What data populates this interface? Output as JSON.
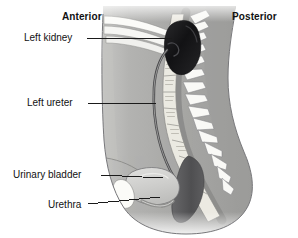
{
  "figure": {
    "background_color": "#ffffff",
    "orientation_labels": {
      "anterior": "Anterior",
      "posterior": "Posterior"
    }
  },
  "labels": [
    {
      "id": "left-kidney",
      "text": "Left kidney",
      "bold": false
    },
    {
      "id": "left-ureter",
      "text": "Left ureter",
      "bold": false
    },
    {
      "id": "urinary-bladder",
      "text": "Urinary bladder",
      "bold": false
    },
    {
      "id": "urethra",
      "text": "Urethra",
      "bold": false
    }
  ],
  "structures": [
    {
      "id": "kidney",
      "name": "Left kidney",
      "color": "#1d1d1f"
    },
    {
      "id": "ureter",
      "name": "Left ureter",
      "color": "#4a4a4c"
    },
    {
      "id": "bladder",
      "name": "Urinary bladder",
      "color": "#d3d3d3"
    },
    {
      "id": "urethra",
      "name": "Urethra",
      "color": "#9a9a9a"
    },
    {
      "id": "spine",
      "name": "Vertebral column",
      "color": "#f0efea"
    },
    {
      "id": "rectum",
      "name": "Rectum",
      "color": "#5c5c5e"
    },
    {
      "id": "pubis",
      "name": "Pubic bone",
      "color": "#f7f7f4"
    },
    {
      "id": "diaphragm",
      "name": "Diaphragm / ribs",
      "color": "#fbfbf8"
    },
    {
      "id": "body",
      "name": "Body outline",
      "color": "#a9a9a7"
    }
  ],
  "palette": {
    "body_fill": "#a9a9a7",
    "body_fill_light": "#bcbcba",
    "outline": "#6e6e6e",
    "leader_line": "#1a1a1a",
    "text": "#111111",
    "bone_white": "#f8f8f5",
    "kidney_dark": "#1d1d1f",
    "rectum_dark": "#5c5c5e",
    "bladder_gray": "#d2d2d0"
  }
}
